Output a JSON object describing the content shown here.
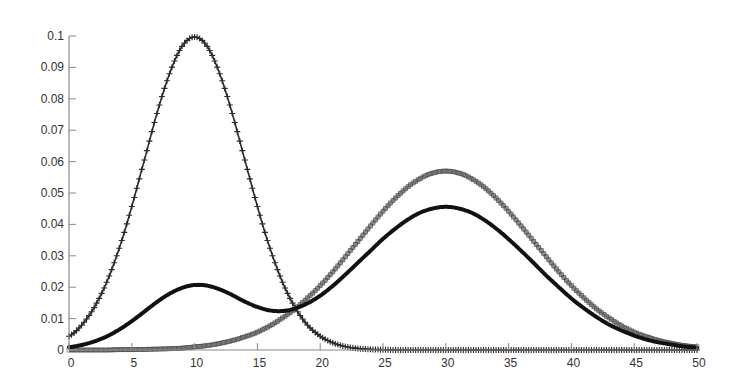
{
  "chart_data": {
    "type": "line",
    "title": "",
    "xlabel": "",
    "ylabel": "",
    "xlim": [
      0,
      50
    ],
    "ylim": [
      0,
      0.1
    ],
    "grid": false,
    "legend": null,
    "x_ticks": [
      "0",
      "5",
      "10",
      "15",
      "20",
      "25",
      "30",
      "35",
      "40",
      "45",
      "50"
    ],
    "y_ticks": [
      "0",
      "0.01",
      "0.02",
      "0.03",
      "0.04",
      "0.05",
      "0.06",
      "0.07",
      "0.08",
      "0.09",
      "0.1"
    ],
    "x": [
      0,
      1,
      2,
      3,
      4,
      5,
      6,
      7,
      8,
      9,
      10,
      11,
      12,
      13,
      14,
      15,
      16,
      17,
      18,
      19,
      20,
      21,
      22,
      23,
      24,
      25,
      26,
      27,
      28,
      29,
      30,
      31,
      32,
      33,
      34,
      35,
      36,
      37,
      38,
      39,
      40,
      41,
      42,
      43,
      44,
      45,
      46,
      47,
      48,
      49,
      50
    ],
    "series": [
      {
        "name": "component 1 (+ markers)",
        "marker": "+",
        "color": "#2a2a2a",
        "values": [
          0.0044,
          0.0079,
          0.0135,
          0.0216,
          0.0324,
          0.0457,
          0.0605,
          0.0753,
          0.088,
          0.0967,
          0.0997,
          0.0967,
          0.088,
          0.0753,
          0.0605,
          0.0457,
          0.0324,
          0.0216,
          0.0135,
          0.0079,
          0.0044,
          0.0023,
          0.0011,
          0.0005,
          0.0002,
          0.0001,
          0,
          0,
          0,
          0,
          0,
          0,
          0,
          0,
          0,
          0,
          0,
          0,
          0,
          0,
          0,
          0,
          0,
          0,
          0,
          0,
          0,
          0,
          0,
          0,
          0
        ]
      },
      {
        "name": "component 2 (dense markers)",
        "marker": "square",
        "color": "#6e6e6e",
        "values": [
          0.0,
          0.0,
          0.0,
          0.0,
          0.0001,
          0.0001,
          0.0002,
          0.0003,
          0.0004,
          0.0006,
          0.001,
          0.0014,
          0.0021,
          0.003,
          0.0042,
          0.0057,
          0.0077,
          0.0102,
          0.0131,
          0.0166,
          0.0205,
          0.0249,
          0.0297,
          0.0346,
          0.0395,
          0.0442,
          0.0484,
          0.052,
          0.0547,
          0.0564,
          0.057,
          0.0564,
          0.0547,
          0.052,
          0.0484,
          0.0442,
          0.0395,
          0.0346,
          0.0297,
          0.0249,
          0.0205,
          0.0166,
          0.0131,
          0.0102,
          0.0077,
          0.0057,
          0.0042,
          0.003,
          0.0021,
          0.0014,
          0.001
        ]
      },
      {
        "name": "mixture (solid line)",
        "marker": "none",
        "color": "#111111",
        "values": [
          0.0009,
          0.0016,
          0.0027,
          0.0043,
          0.0065,
          0.0092,
          0.0122,
          0.0153,
          0.0179,
          0.0198,
          0.0207,
          0.0205,
          0.0193,
          0.0175,
          0.0154,
          0.0137,
          0.0126,
          0.0124,
          0.0132,
          0.0149,
          0.0173,
          0.0204,
          0.024,
          0.0278,
          0.0316,
          0.0354,
          0.0387,
          0.0416,
          0.0438,
          0.0451,
          0.0456,
          0.0451,
          0.0438,
          0.0416,
          0.0387,
          0.0353,
          0.0316,
          0.0277,
          0.0237,
          0.02,
          0.0164,
          0.0133,
          0.0105,
          0.0081,
          0.0062,
          0.0046,
          0.0033,
          0.0024,
          0.0017,
          0.0011,
          0.0008
        ]
      }
    ]
  }
}
